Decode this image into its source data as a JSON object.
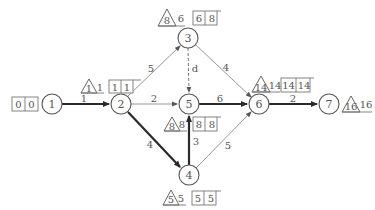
{
  "diagram": {
    "type": "activity-on-arrow network (double-code network diagram)",
    "nodes": [
      {
        "id": "1",
        "label": "1",
        "x": 52,
        "y": 104
      },
      {
        "id": "2",
        "label": "2",
        "x": 121,
        "y": 104
      },
      {
        "id": "3",
        "label": "3",
        "x": 188,
        "y": 38
      },
      {
        "id": "4",
        "label": "4",
        "x": 189,
        "y": 175
      },
      {
        "id": "5",
        "label": "5",
        "x": 189,
        "y": 104
      },
      {
        "id": "6",
        "label": "6",
        "x": 259,
        "y": 104
      },
      {
        "id": "7",
        "label": "7",
        "x": 329,
        "y": 104
      }
    ],
    "edges": [
      {
        "from": "1",
        "to": "2",
        "label": "1",
        "style": "thick",
        "critical": true
      },
      {
        "from": "2",
        "to": "3",
        "label": "5",
        "style": "thin",
        "critical": false
      },
      {
        "from": "2",
        "to": "5",
        "label": "2",
        "style": "thin",
        "critical": false
      },
      {
        "from": "2",
        "to": "4",
        "label": "4",
        "style": "thick",
        "critical": true
      },
      {
        "from": "3",
        "to": "5",
        "label": "d",
        "style": "dashed",
        "critical": false
      },
      {
        "from": "3",
        "to": "6",
        "label": "4",
        "style": "thin",
        "critical": false
      },
      {
        "from": "4",
        "to": "5",
        "label": "3",
        "style": "thick",
        "critical": true
      },
      {
        "from": "4",
        "to": "6",
        "label": "5",
        "style": "thin",
        "critical": false
      },
      {
        "from": "5",
        "to": "6",
        "label": "6",
        "style": "thick",
        "critical": true
      },
      {
        "from": "6",
        "to": "7",
        "label": "2",
        "style": "thick",
        "critical": true
      }
    ],
    "node_times": [
      {
        "node": "1",
        "triangle": null,
        "triangle_side": null,
        "box": [
          "0",
          "0"
        ]
      },
      {
        "node": "2",
        "triangle": "1",
        "triangle_side": "1",
        "box": [
          "1",
          "1"
        ]
      },
      {
        "node": "3",
        "triangle": "8",
        "triangle_side": "6",
        "box": [
          "6",
          "8"
        ]
      },
      {
        "node": "5",
        "triangle": "8",
        "triangle_side": "8",
        "box": [
          "8",
          "8"
        ]
      },
      {
        "node": "4",
        "triangle": "5",
        "triangle_side": "5",
        "box": [
          "5",
          "5"
        ]
      },
      {
        "node": "6",
        "triangle": "14",
        "triangle_side": "14",
        "box": [
          "14",
          "14"
        ]
      },
      {
        "node": "7",
        "triangle": "16",
        "triangle_side": "16",
        "box": null
      }
    ]
  },
  "labels": {
    "n1": "1",
    "n2": "2",
    "n3": "3",
    "n4": "4",
    "n5": "5",
    "n6": "6",
    "n7": "7",
    "e12": "1",
    "e23": "5",
    "e25": "2",
    "e24": "4",
    "e35": "d",
    "e36": "4",
    "e45": "3",
    "e46": "5",
    "e56": "6",
    "e67": "2",
    "t1_box_a": "0",
    "t1_box_b": "0",
    "t2_tri": "1",
    "t2_side": "1",
    "t2_box_a": "1",
    "t2_box_b": "1",
    "t3_tri": "8",
    "t3_side": "6",
    "t3_box_a": "6",
    "t3_box_b": "8",
    "t5_tri": "8",
    "t5_side": "8",
    "t5_box_a": "8",
    "t5_box_b": "8",
    "t4_tri": "5",
    "t4_side": "5",
    "t4_box_a": "5",
    "t4_box_b": "5",
    "t6_tri": "14",
    "t6_side": "14",
    "t6_box_a": "14",
    "t6_box_b": "14",
    "t7_tri": "16",
    "t7_side": "16"
  },
  "colors": {
    "critical_edge": "#2a2a2a",
    "normal_edge": "#8a8a8a",
    "text": "#555555",
    "background": "#ffffff"
  }
}
